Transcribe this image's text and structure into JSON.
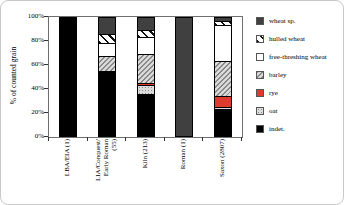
{
  "chart_data": {
    "type": "bar",
    "stacked": true,
    "title": "",
    "xlabel": "",
    "ylabel": "% of counted grain",
    "ylim": [
      0,
      100
    ],
    "yticks": [
      {
        "value": 0,
        "label": "0%"
      },
      {
        "value": 20,
        "label": "20%"
      },
      {
        "value": 40,
        "label": "40%"
      },
      {
        "value": 60,
        "label": "60%"
      },
      {
        "value": 80,
        "label": "80%"
      },
      {
        "value": 100,
        "label": "100%"
      }
    ],
    "grid": false,
    "legend_position": "right",
    "categories": [
      {
        "label": "LBA/EIA (1)",
        "lines": [
          "LBA/EIA (1)"
        ]
      },
      {
        "label": "LIA/Conquest/ Early Roman (55)",
        "lines": [
          "LIA/Conquest/",
          "Early Roman",
          "(55)"
        ]
      },
      {
        "label": "Kiln (213)",
        "lines": [
          "Kiln (213)"
        ]
      },
      {
        "label": "Roman (1)",
        "lines": [
          "Roman (1)"
        ]
      },
      {
        "label": "Saxon (2807)",
        "lines": [
          "Saxon (2807)"
        ]
      }
    ],
    "series": [
      {
        "name": "wheat sp.",
        "key": "wheat_sp",
        "fill": "solid dark gray",
        "values": [
          0,
          14,
          11,
          100,
          3
        ]
      },
      {
        "name": "hulled wheat",
        "key": "hulled_wheat",
        "fill": "backslash hatch on white",
        "values": [
          0,
          8,
          6,
          0,
          4
        ]
      },
      {
        "name": "free-threshing wheat",
        "key": "free_threshing_wheat",
        "fill": "solid white",
        "values": [
          0,
          11,
          14,
          0,
          30
        ]
      },
      {
        "name": "barley",
        "key": "barley",
        "fill": "forward-slash gray hatch",
        "values": [
          0,
          13,
          25,
          0,
          30
        ]
      },
      {
        "name": "rye",
        "key": "rye",
        "fill": "solid red",
        "values": [
          0,
          0,
          2,
          0,
          9
        ]
      },
      {
        "name": "oat",
        "key": "oat",
        "fill": "stippled light gray",
        "values": [
          0,
          0,
          7,
          0,
          2
        ]
      },
      {
        "name": "indet.",
        "key": "indet",
        "fill": "solid black",
        "values": [
          100,
          54,
          35,
          0,
          22
        ]
      }
    ],
    "colors": {
      "wheat_sp": "#404040",
      "free_threshing_wheat": "#ffffff",
      "rye": "#dd3b30",
      "oat_base": "#dcdcdc",
      "indet": "#000000",
      "hatch_gray": "#8a8a8a",
      "hatch_bg": "#d9d9d9"
    }
  }
}
